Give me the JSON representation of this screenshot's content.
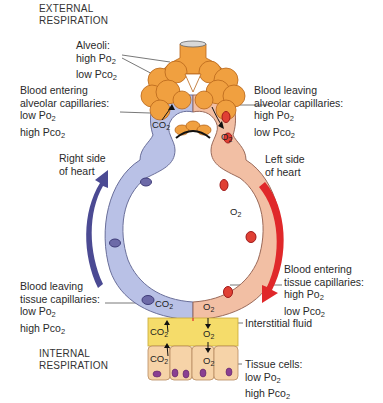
{
  "headings": {
    "external": [
      "EXTERNAL",
      "RESPIRATION"
    ],
    "internal": [
      "INTERNAL",
      "RESPIRATION"
    ]
  },
  "labels": {
    "alveoli": {
      "title": "Alveoli:",
      "line1": "high Po",
      "line1_sub": "2",
      "line2": "low Pco",
      "line2_sub": "2"
    },
    "blood_entering_alveolar": {
      "line1": "Blood entering",
      "line2": "alveolar capillaries:",
      "line3": "low Po",
      "line3_sub": "2",
      "line4": "high Pco",
      "line4_sub": "2"
    },
    "blood_leaving_alveolar": {
      "line1": "Blood leaving",
      "line2": "alveolar capillaries:",
      "line3": "high Po",
      "line3_sub": "2",
      "line4": "low Pco",
      "line4_sub": "2"
    },
    "right_heart": {
      "line1": "Right side",
      "line2": "of heart"
    },
    "left_heart": {
      "line1": "Left side",
      "line2": "of heart"
    },
    "blood_leaving_tissue": {
      "line1": "Blood leaving",
      "line2": "tissue capillaries:",
      "line3": "low Po",
      "line3_sub": "2",
      "line4": "high Pco",
      "line4_sub": "2"
    },
    "blood_entering_tissue": {
      "line1": "Blood entering",
      "line2": "tissue capillaries:",
      "line3": "high Po",
      "line3_sub": "2",
      "line4": "low Pco",
      "line4_sub": "2"
    },
    "interstitial_fluid": "Interstitial fluid",
    "tissue_cells": {
      "title": "Tissue cells:",
      "line1": "low Po",
      "line1_sub": "2",
      "line2": "high Pco",
      "line2_sub": "2"
    }
  },
  "gas_labels": {
    "co2": "CO",
    "o2": "O",
    "sub": "2"
  },
  "colors": {
    "deoxygenated_vessel": "#b9c1e6",
    "oxygenated_vessel": "#f2bfa4",
    "alveoli": "#f0a040",
    "interstitial_fluid": "#f5dc6a",
    "tissue_cell": "#f6d3a8",
    "nucleus": "#8a3f92",
    "blue_arrow": "#4b4a93",
    "red_arrow": "#e0282a"
  }
}
